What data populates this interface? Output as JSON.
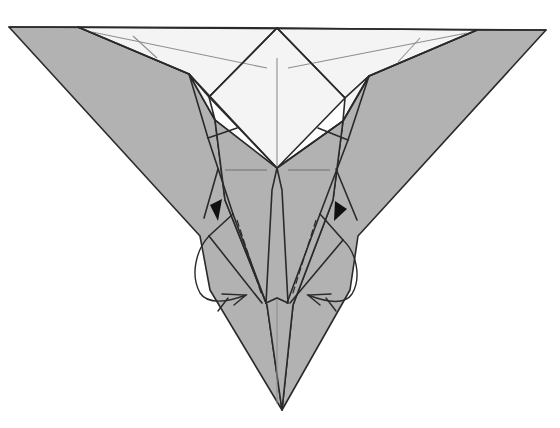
{
  "diagram": {
    "type": "origami-folding-step",
    "colors": {
      "paper_colored_side": "#b2b2b2",
      "paper_white_side": "#f4f4f4",
      "line": "#2a2a2a",
      "crease": "#8e8e8e",
      "pointer_triangle": "#111111"
    },
    "symbols": [
      {
        "name": "push-in-pointer-left",
        "glyph": "filled-triangle",
        "meaning": "push / sink here"
      },
      {
        "name": "push-in-pointer-right",
        "glyph": "filled-triangle",
        "meaning": "push / sink here"
      },
      {
        "name": "inside-reverse-fold-arrow-left",
        "glyph": "looped-arrow",
        "meaning": "fold inside"
      },
      {
        "name": "inside-reverse-fold-arrow-right",
        "glyph": "looped-arrow",
        "meaning": "fold inside"
      }
    ],
    "fold_lines": [
      {
        "name": "valley-fold-left",
        "style": "dashed"
      },
      {
        "name": "valley-fold-right",
        "style": "dashed"
      }
    ]
  }
}
